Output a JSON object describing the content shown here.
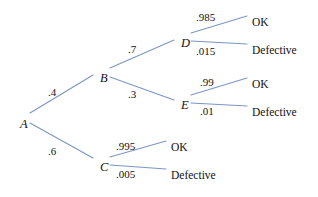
{
  "diagram": {
    "type": "probability-tree",
    "line_color": "#7B96C4",
    "text_color": "#111111",
    "background": "#ffffff",
    "nodes": [
      {
        "id": "A",
        "label": "A",
        "x": 20,
        "y": 118
      },
      {
        "id": "B",
        "label": "B",
        "x": 100,
        "y": 72
      },
      {
        "id": "C",
        "label": "C",
        "x": 100,
        "y": 161
      },
      {
        "id": "D",
        "label": "D",
        "x": 181,
        "y": 37
      },
      {
        "id": "E",
        "label": "E",
        "x": 181,
        "y": 99
      }
    ],
    "outcomes": [
      {
        "id": "d-ok",
        "label": "OK",
        "x": 252,
        "y": 17
      },
      {
        "id": "d-def",
        "label": "Defective",
        "x": 252,
        "y": 45
      },
      {
        "id": "e-ok",
        "label": "OK",
        "x": 252,
        "y": 79
      },
      {
        "id": "e-def",
        "label": "Defective",
        "x": 252,
        "y": 107
      },
      {
        "id": "c-ok",
        "label": "OK",
        "x": 171,
        "y": 142
      },
      {
        "id": "c-def",
        "label": "Defective",
        "x": 171,
        "y": 170
      }
    ],
    "branches": [
      {
        "id": "A-B",
        "from": "A",
        "to": "B",
        "probability": ".4",
        "x1": 30,
        "y1": 113,
        "x2": 93,
        "y2": 75,
        "lx": 48,
        "ly": 87
      },
      {
        "id": "A-C",
        "from": "A",
        "to": "C",
        "probability": ".6",
        "x1": 30,
        "y1": 123,
        "x2": 93,
        "y2": 158,
        "lx": 48,
        "ly": 146
      },
      {
        "id": "B-D",
        "from": "B",
        "to": "D",
        "probability": ".7",
        "x1": 110,
        "y1": 68,
        "x2": 174,
        "y2": 40,
        "lx": 128,
        "ly": 44
      },
      {
        "id": "B-E",
        "from": "B",
        "to": "E",
        "probability": ".3",
        "x1": 110,
        "y1": 77,
        "x2": 174,
        "y2": 100,
        "lx": 128,
        "ly": 89
      },
      {
        "id": "D-OK",
        "from": "D",
        "to": "d-ok",
        "probability": ".985",
        "x1": 191,
        "y1": 33,
        "x2": 247,
        "y2": 16,
        "lx": 196,
        "ly": 12
      },
      {
        "id": "D-DEF",
        "from": "D",
        "to": "d-def",
        "probability": ".015",
        "x1": 191,
        "y1": 41,
        "x2": 247,
        "y2": 44,
        "lx": 196,
        "ly": 46
      },
      {
        "id": "E-OK",
        "from": "E",
        "to": "e-ok",
        "probability": ".99",
        "x1": 191,
        "y1": 95,
        "x2": 247,
        "y2": 78,
        "lx": 200,
        "ly": 77
      },
      {
        "id": "E-DEF",
        "from": "E",
        "to": "e-def",
        "probability": ".01",
        "x1": 191,
        "y1": 103,
        "x2": 247,
        "y2": 106,
        "lx": 200,
        "ly": 106
      },
      {
        "id": "C-OK",
        "from": "C",
        "to": "c-ok",
        "probability": ".995",
        "x1": 110,
        "y1": 157,
        "x2": 166,
        "y2": 141,
        "lx": 116,
        "ly": 141
      },
      {
        "id": "C-DEF",
        "from": "C",
        "to": "c-def",
        "probability": ".005",
        "x1": 110,
        "y1": 165,
        "x2": 166,
        "y2": 169,
        "lx": 116,
        "ly": 169
      }
    ]
  }
}
